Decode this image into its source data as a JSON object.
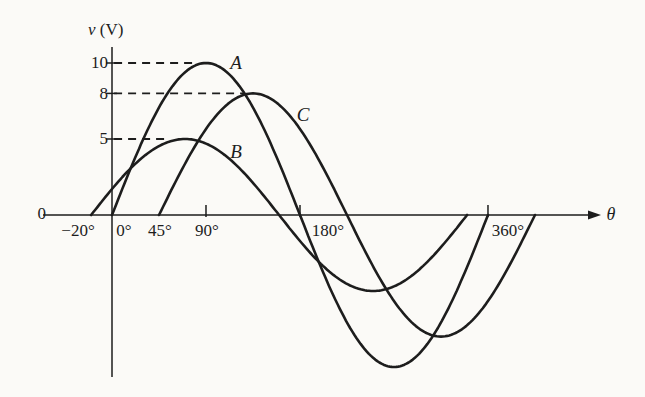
{
  "figure": {
    "background": "#fbfaf7",
    "ink_color": "#1d1d1d",
    "y_axis_symbol": "v",
    "y_axis_unit": "(V)",
    "x_axis_symbol": "θ",
    "origin_label": "0"
  },
  "chart_data": {
    "type": "line",
    "title": "",
    "xlabel": "θ",
    "ylabel": "v (V)",
    "x_unit": "degrees",
    "grid": false,
    "legend": "none (curves labeled inline A, B, C)",
    "x_tick_labels": [
      "−20°",
      "0°",
      "45°",
      "90°",
      "180°",
      "360°"
    ],
    "x_tick_degrees": [
      -20,
      0,
      45,
      90,
      180,
      360
    ],
    "x_ticks_marked_on_axis_deg": [
      90,
      180,
      360
    ],
    "y_tick_labels": [
      "10",
      "8",
      "5"
    ],
    "y_tick_values": [
      10,
      8,
      5
    ],
    "xlim_deg": [
      -66,
      460
    ],
    "ylim_v": [
      -11,
      11
    ],
    "series": [
      {
        "name": "A",
        "amplitude_v": 10,
        "phase_shift_deg": 0,
        "peak_v": 10,
        "peak_at_deg": 90,
        "zero_crossings_deg": [
          0,
          180,
          360
        ],
        "drawn_from_deg": 0,
        "drawn_to_deg": 360
      },
      {
        "name": "B",
        "amplitude_v": 5,
        "phase_shift_deg": 20,
        "peak_v": 5,
        "peak_at_deg": 70,
        "zero_crossings_deg": [
          -20,
          160,
          340
        ],
        "drawn_from_deg": -20,
        "drawn_to_deg": 340
      },
      {
        "name": "C",
        "amplitude_v": 8,
        "phase_shift_deg": -45,
        "peak_v": 8,
        "peak_at_deg": 135,
        "zero_crossings_deg": [
          45,
          225,
          405
        ],
        "drawn_from_deg": 45,
        "drawn_to_deg": 405
      }
    ],
    "dashed_guides": [
      {
        "v": 10,
        "from_deg": 2,
        "to_deg": 82
      },
      {
        "v": 8,
        "from_deg": 2,
        "to_deg": 127
      },
      {
        "v": 5,
        "from_deg": 2,
        "to_deg": 55
      }
    ],
    "layout_px": {
      "x0_px": 112,
      "px_per_deg": 1.0444,
      "y0_px": 215,
      "px_per_volt": 15.2,
      "x_axis_from_px": 43,
      "x_axis_to_px": 588,
      "y_axis_top_px": 47,
      "y_axis_bottom_px": 377,
      "curve_stroke_px": 2.6,
      "axis_stroke_px": 1.5
    }
  }
}
